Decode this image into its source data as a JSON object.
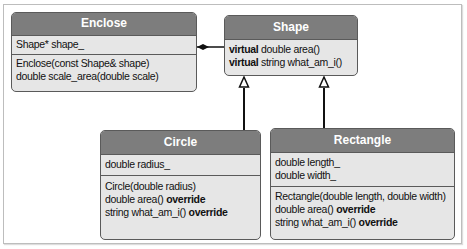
{
  "diagram": {
    "type": "UML class diagram",
    "classes": {
      "enclose": {
        "name": "Enclose",
        "attributes": [
          {
            "pre": "",
            "text": "Shape* shape_",
            "post": ""
          }
        ],
        "methods": [
          {
            "pre": "",
            "text": "Enclose(const Shape& shape)",
            "post": ""
          },
          {
            "pre": "",
            "text": "double scale_area(double scale)",
            "post": ""
          }
        ]
      },
      "shape": {
        "name": "Shape",
        "methods": [
          {
            "pre": "virtual",
            "text": " double area()",
            "post": ""
          },
          {
            "pre": "virtual",
            "text": " string what_am_i()",
            "post": ""
          }
        ]
      },
      "circle": {
        "name": "Circle",
        "attributes": [
          {
            "pre": "",
            "text": "double radius_",
            "post": ""
          }
        ],
        "methods": [
          {
            "pre": "",
            "text": "Circle(double radius)",
            "post": ""
          },
          {
            "pre": "",
            "text": "double area() ",
            "post": "override"
          },
          {
            "pre": "",
            "text": "string what_am_i() ",
            "post": "override"
          }
        ]
      },
      "rectangle": {
        "name": "Rectangle",
        "attributes": [
          {
            "pre": "",
            "text": "double length_",
            "post": ""
          },
          {
            "pre": "",
            "text": "double width_",
            "post": ""
          }
        ],
        "methods": [
          {
            "pre": "",
            "text": "Rectangle(double length, double width)",
            "post": ""
          },
          {
            "pre": "",
            "text": "double area() ",
            "post": "override"
          },
          {
            "pre": "",
            "text": "string what_am_i() ",
            "post": "override"
          }
        ]
      }
    },
    "relationships": [
      {
        "from": "Enclose",
        "to": "Shape",
        "kind": "composition"
      },
      {
        "from": "Circle",
        "to": "Shape",
        "kind": "inheritance"
      },
      {
        "from": "Rectangle",
        "to": "Shape",
        "kind": "inheritance"
      }
    ],
    "colors": {
      "header": "#7d7d7d",
      "body": "#e6e6e6",
      "border": "#5a5a5a"
    }
  }
}
